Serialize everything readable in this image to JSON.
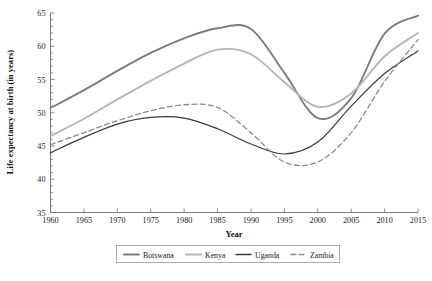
{
  "chart_data": {
    "type": "line",
    "title": "",
    "xlabel": "Year",
    "ylabel": "Life expectancy at birth (in years)",
    "xlim": [
      1960,
      2015
    ],
    "ylim": [
      35,
      65
    ],
    "xticks": [
      1960,
      1965,
      1970,
      1975,
      1980,
      1985,
      1990,
      1995,
      2000,
      2005,
      2010,
      2015
    ],
    "yticks": [
      35,
      40,
      45,
      50,
      55,
      60,
      65
    ],
    "xticklabels": [
      "1960",
      "1965",
      "1970",
      "1975",
      "1980",
      "1985",
      "1990",
      "1995",
      "2000",
      "2005",
      "2010",
      "2015"
    ],
    "yticklabels": [
      "35",
      "40",
      "45",
      "50",
      "55",
      "60",
      "65"
    ],
    "grid": false,
    "legend_position": "bottom",
    "x": [
      1960,
      1965,
      1970,
      1975,
      1980,
      1985,
      1990,
      1995,
      2000,
      2005,
      2010,
      2015
    ],
    "series": [
      {
        "name": "Botswana",
        "color": "#7d7d7d",
        "dash": "solid",
        "width": 1.9,
        "values": [
          50.7,
          53.4,
          56.3,
          59.0,
          61.2,
          62.7,
          62.6,
          56.0,
          49.2,
          52.2,
          61.9,
          64.6
        ]
      },
      {
        "name": "Kenya",
        "color": "#b6b6b6",
        "dash": "solid",
        "width": 1.9,
        "values": [
          46.5,
          49.1,
          52.0,
          54.8,
          57.4,
          59.5,
          58.8,
          54.6,
          50.9,
          52.9,
          58.5,
          62.0
        ]
      },
      {
        "name": "Uganda",
        "color": "#3a3a3a",
        "dash": "solid",
        "width": 1.2,
        "values": [
          44.0,
          46.3,
          48.3,
          49.3,
          49.2,
          47.6,
          45.3,
          43.8,
          45.6,
          51.0,
          55.9,
          59.3
        ]
      },
      {
        "name": "Zambia",
        "color": "#8a8a8a",
        "dash": "dashed",
        "width": 1.3,
        "values": [
          45.2,
          47.0,
          48.8,
          50.3,
          51.2,
          50.8,
          47.0,
          42.6,
          42.6,
          47.0,
          54.7,
          61.0
        ]
      }
    ]
  },
  "legend": {
    "items": [
      {
        "label": "Botswana"
      },
      {
        "label": "Kenya"
      },
      {
        "label": "Uganda"
      },
      {
        "label": "Zambia"
      }
    ]
  }
}
